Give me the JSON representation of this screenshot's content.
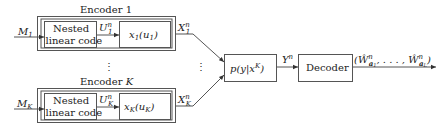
{
  "encoders": [
    {
      "title": "Encoder 1",
      "input": "M",
      "input_sub": "1",
      "nested_line1": "Nested",
      "nested_line2": "linear code",
      "u_label": "U",
      "u_sup": "n",
      "u_sub": "1",
      "map_label": "x",
      "map_sub": "1",
      "map_arg": "(u",
      "map_arg_sub": "1",
      "map_close": ")",
      "x_label": "X",
      "x_sup": "n",
      "x_sub": "1"
    },
    {
      "title": "Encoder ",
      "title_var": "K",
      "input": "M",
      "input_sub": "K",
      "nested_line1": "Nested",
      "nested_line2": "linear code",
      "u_label": "U",
      "u_sup": "n",
      "u_sub": "K",
      "map_label": "x",
      "map_sub": "K",
      "map_arg": "(u",
      "map_arg_sub": "K",
      "map_close": ")",
      "x_label": "X",
      "x_sup": "n",
      "x_sub": "K"
    }
  ],
  "vdots": "⋮",
  "channel": {
    "label": "p(y|x",
    "sup": "K",
    "close": ")"
  },
  "channel_output": {
    "label": "Y",
    "sup": "n"
  },
  "decoder": {
    "label": "Decoder"
  },
  "decoder_output": {
    "open": "(",
    "w1": "Ŵ",
    "w1_sup": "n",
    "w1_sub": "a",
    "w1_subsub": "1",
    "sep": ", . . . , ",
    "w2": "Ŵ",
    "w2_sup": "n",
    "w2_sub": "a",
    "w2_subsub": "L",
    "close": ")"
  }
}
